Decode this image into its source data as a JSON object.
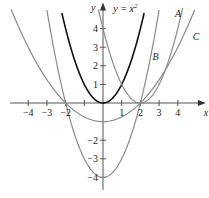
{
  "chart_data": {
    "type": "line",
    "title": "",
    "xlabel": "x",
    "ylabel": "y",
    "xlim": [
      -5.3,
      5.5
    ],
    "ylim": [
      -4.6,
      5.4
    ],
    "x_ticks": [
      -4,
      -3,
      -2,
      -1,
      1,
      2,
      3,
      4
    ],
    "x_tick_labels": [
      "-4",
      "-3",
      "-2",
      "",
      "1",
      "2",
      "3",
      "4"
    ],
    "y_ticks": [
      4,
      3,
      2,
      1,
      -1,
      -2,
      -3,
      -4
    ],
    "y_tick_labels": [
      "4",
      "3",
      "2",
      "1",
      "",
      "-2",
      "-3",
      "-4"
    ],
    "grid": false,
    "series": [
      {
        "name": "y = x^2",
        "formula": "x^2",
        "label": "y = x²",
        "color": "#111111",
        "x_range": [
          -2.2,
          2.2
        ]
      },
      {
        "name": "A",
        "formula": "(x-2)^2",
        "label": "A",
        "color": "#8a8a8a",
        "x_range": [
          -0.4,
          4.3
        ]
      },
      {
        "name": "B",
        "formula": "x^2-4",
        "label": "B",
        "color": "#8a8a8a",
        "x_range": [
          -3.0,
          3.0
        ]
      },
      {
        "name": "C",
        "formula": "x^2/4-1",
        "label": "C",
        "color": "#8a8a8a",
        "x_range": [
          -5.0,
          4.9
        ]
      }
    ],
    "annotations": [
      {
        "text": "y = x",
        "sup": "2",
        "x": 0.55,
        "y": 4.9
      },
      {
        "text": "A",
        "x": 3.85,
        "y": 4.6
      },
      {
        "text": "B",
        "x": 2.65,
        "y": 2.3
      },
      {
        "text": "C",
        "x": 4.8,
        "y": 3.4
      }
    ]
  }
}
